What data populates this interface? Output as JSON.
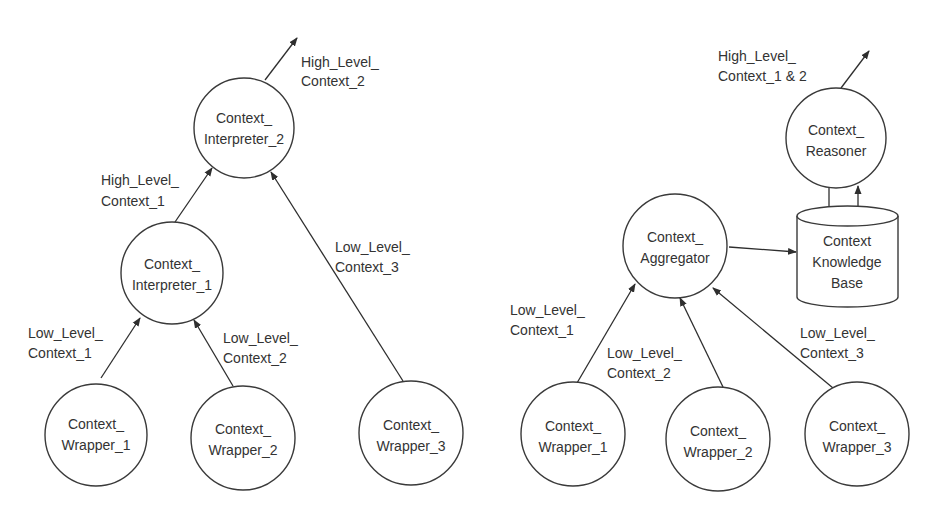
{
  "diagrams": [
    {
      "name": "interpreter-based-architecture",
      "nodes": [
        {
          "id": "interpreter_2",
          "line1": "Context_",
          "line2": "Interpreter_2"
        },
        {
          "id": "interpreter_1",
          "line1": "Context_",
          "line2": "Interpreter_1"
        },
        {
          "id": "wrapper_1",
          "line1": "Context_",
          "line2": "Wrapper_1"
        },
        {
          "id": "wrapper_2",
          "line1": "Context_",
          "line2": "Wrapper_2"
        },
        {
          "id": "wrapper_3",
          "line1": "Context_",
          "line2": "Wrapper_3"
        }
      ],
      "edges": [
        {
          "from": "interpreter_2",
          "to": "output",
          "line1": "High_Level_",
          "line2": "Context_2"
        },
        {
          "from": "interpreter_1",
          "to": "interpreter_2",
          "line1": "High_Level_",
          "line2": "Context_1"
        },
        {
          "from": "wrapper_3",
          "to": "interpreter_2",
          "line1": "Low_Level_",
          "line2": "Context_3"
        },
        {
          "from": "wrapper_1",
          "to": "interpreter_1",
          "line1": "Low_Level_",
          "line2": "Context_1"
        },
        {
          "from": "wrapper_2",
          "to": "interpreter_1",
          "line1": "Low_Level_",
          "line2": "Context_2"
        }
      ]
    },
    {
      "name": "aggregator-reasoner-architecture",
      "nodes": [
        {
          "id": "reasoner",
          "line1": "Context_",
          "line2": "Reasoner"
        },
        {
          "id": "aggregator",
          "line1": "Context_",
          "line2": "Aggregator"
        },
        {
          "id": "knowledge_base",
          "line1": "Context",
          "line2": "Knowledge",
          "line3": "Base"
        },
        {
          "id": "wrapper_1",
          "line1": "Context_",
          "line2": "Wrapper_1"
        },
        {
          "id": "wrapper_2",
          "line1": "Context_",
          "line2": "Wrapper_2"
        },
        {
          "id": "wrapper_3",
          "line1": "Context_",
          "line2": "Wrapper_3"
        }
      ],
      "edges": [
        {
          "from": "reasoner",
          "to": "output",
          "line1": "High_Level_",
          "line2": "Context_1 & 2"
        },
        {
          "from": "reasoner",
          "to": "knowledge_base"
        },
        {
          "from": "knowledge_base",
          "to": "reasoner"
        },
        {
          "from": "aggregator",
          "to": "knowledge_base"
        },
        {
          "from": "wrapper_1",
          "to": "aggregator",
          "line1": "Low_Level_",
          "line2": "Context_1"
        },
        {
          "from": "wrapper_2",
          "to": "aggregator",
          "line1": "Low_Level_",
          "line2": "Context_2"
        },
        {
          "from": "wrapper_3",
          "to": "aggregator",
          "line1": "Low_Level_",
          "line2": "Context_3"
        }
      ]
    }
  ]
}
